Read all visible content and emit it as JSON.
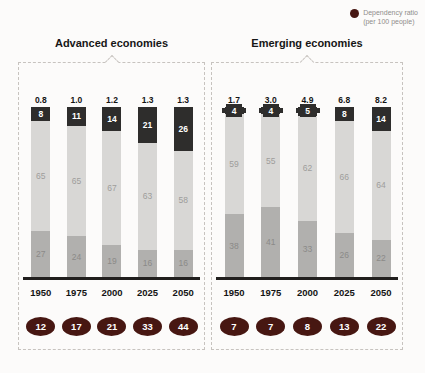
{
  "legend": {
    "dot_color": "#471712",
    "label_line1": "Dependency ratio",
    "label_line2": "(per 100 people)"
  },
  "colors": {
    "dark_segment": "#2e2d2c",
    "light_segment": "#d8d7d5",
    "medium_segment": "#b1b0ae",
    "oval": "#471712",
    "axis": "#211f1e",
    "dashed_border": "#c7c3bf"
  },
  "panels": [
    {
      "title": "Advanced economies",
      "bars": [
        {
          "year": "1950",
          "pop": "0.8",
          "top": 8,
          "mid": 65,
          "bottom": 27,
          "ratio": "12"
        },
        {
          "year": "1975",
          "pop": "1.0",
          "top": 11,
          "mid": 65,
          "bottom": 24,
          "ratio": "17"
        },
        {
          "year": "2000",
          "pop": "1.2",
          "top": 14,
          "mid": 67,
          "bottom": 19,
          "ratio": "21"
        },
        {
          "year": "2025",
          "pop": "1.3",
          "top": 21,
          "mid": 63,
          "bottom": 16,
          "ratio": "33"
        },
        {
          "year": "2050",
          "pop": "1.3",
          "top": 26,
          "mid": 58,
          "bottom": 16,
          "ratio": "44"
        }
      ]
    },
    {
      "title": "Emerging economies",
      "bars": [
        {
          "year": "1950",
          "pop": "1.7",
          "top": 4,
          "mid": 59,
          "bottom": 38,
          "ratio": "7"
        },
        {
          "year": "1975",
          "pop": "3.0",
          "top": 4,
          "mid": 55,
          "bottom": 41,
          "ratio": "7"
        },
        {
          "year": "2000",
          "pop": "4.9",
          "top": 5,
          "mid": 62,
          "bottom": 33,
          "ratio": "8"
        },
        {
          "year": "2025",
          "pop": "6.8",
          "top": 8,
          "mid": 66,
          "bottom": 26,
          "ratio": "13"
        },
        {
          "year": "2050",
          "pop": "8.2",
          "top": 14,
          "mid": 64,
          "bottom": 22,
          "ratio": "22"
        }
      ]
    }
  ],
  "chart_data": [
    {
      "type": "bar",
      "stacked": true,
      "title": "Advanced economies",
      "categories": [
        "1950",
        "1975",
        "2000",
        "2025",
        "2050"
      ],
      "series": [
        {
          "name": "top dark segment",
          "values": [
            8,
            11,
            14,
            21,
            26
          ]
        },
        {
          "name": "middle light segment",
          "values": [
            65,
            65,
            67,
            63,
            58
          ]
        },
        {
          "name": "bottom medium segment",
          "values": [
            27,
            24,
            19,
            16,
            16
          ]
        }
      ],
      "above_bar_labels": [
        "0.8",
        "1.0",
        "1.2",
        "1.3",
        "1.3"
      ],
      "dependency_ratio_per_100_people": [
        12,
        17,
        21,
        33,
        44
      ],
      "ylim": [
        0,
        100
      ],
      "grid": false,
      "legend_position": "top-right"
    },
    {
      "type": "bar",
      "stacked": true,
      "title": "Emerging economies",
      "categories": [
        "1950",
        "1975",
        "2000",
        "2025",
        "2050"
      ],
      "series": [
        {
          "name": "top dark segment",
          "values": [
            4,
            4,
            5,
            8,
            14
          ]
        },
        {
          "name": "middle light segment",
          "values": [
            59,
            55,
            62,
            66,
            64
          ]
        },
        {
          "name": "bottom medium segment",
          "values": [
            38,
            41,
            33,
            26,
            22
          ]
        }
      ],
      "above_bar_labels": [
        "1.7",
        "3.0",
        "4.9",
        "6.8",
        "8.2"
      ],
      "dependency_ratio_per_100_people": [
        7,
        7,
        8,
        13,
        22
      ],
      "ylim": [
        0,
        100
      ],
      "grid": false,
      "legend_position": "top-right"
    }
  ]
}
